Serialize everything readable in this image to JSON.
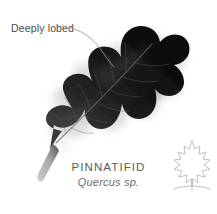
{
  "card": {
    "background_color": "#ffffff",
    "leaf_color": "#111111",
    "leaf_shadow_color": "#c9c9c9",
    "petiole_color": "#b8b8b8",
    "midrib_color": "#6d6d6d"
  },
  "annotation": {
    "label": "Deeply lobed",
    "label_color": "#4a4a4a",
    "leader_line_color": "#9a9a9a"
  },
  "caption": {
    "title": "PINNATIFID",
    "subtitle": "Quercus sp.",
    "title_color": "#5b5b5b",
    "subtitle_color": "#6e6e6e"
  },
  "corner_glyph": {
    "icon": "leaf-outline-icon",
    "stroke_color": "#b3b3b3"
  }
}
